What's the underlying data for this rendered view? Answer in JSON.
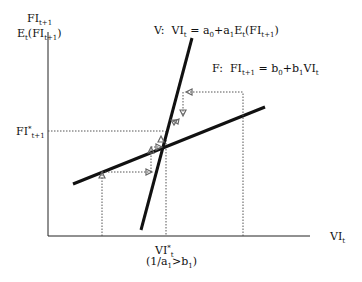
{
  "diagram": {
    "type": "economic-cobweb-diagram",
    "y_axis": {
      "label_line1": "FI",
      "label_line1_sub": "t+1",
      "label_line2": "E",
      "label_line2_sub": "t",
      "label_line2_rest": "(FI",
      "label_line2_sub2": "t+1",
      "label_line2_close": ")"
    },
    "x_axis": {
      "label": "VI",
      "label_sub": "t"
    },
    "curves": {
      "V": {
        "name": "V:",
        "lhs": "VI",
        "lhs_sub": "t",
        "eq": " = a",
        "a0_sub": "0",
        "plus": "+a",
        "a1_sub": "1",
        "e": "E",
        "e_sub": "t",
        "rest": "(FI",
        "rest_sub": "t+1",
        "close": ")"
      },
      "F": {
        "name": "F:",
        "lhs": "FI",
        "lhs_sub": "t+1",
        "eq": " = b",
        "b0_sub": "0",
        "plus": "+b",
        "b1_sub": "1",
        "rhs": "VI",
        "rhs_sub": "t"
      }
    },
    "equilibrium": {
      "fi_label": "FI",
      "fi_sup": "*",
      "fi_sub": "t+1",
      "vi_label": "VI",
      "vi_sup": "*",
      "vi_sub": "t",
      "condition": "(1/a",
      "condition_sub1": "1",
      "condition_mid": ">b",
      "condition_sub2": "1",
      "condition_close": ")"
    },
    "colors": {
      "line": "#111111",
      "dotted": "#555555",
      "arrow": "#666666"
    }
  }
}
